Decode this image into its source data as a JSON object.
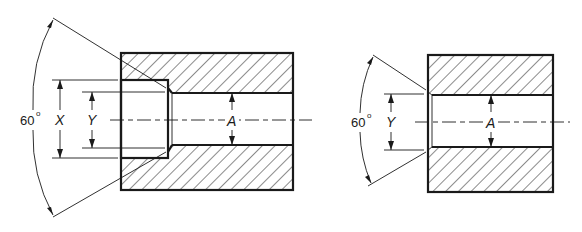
{
  "figure": {
    "left_view": {
      "name": "counterbored hole section",
      "angle_label": "60",
      "angle_unit": "o",
      "dim_outer_label": "X",
      "dim_inner_label": "Y",
      "bore_label": "A"
    },
    "right_view": {
      "name": "countersunk hole section",
      "angle_label": "60",
      "angle_unit": "o",
      "dim_inner_label": "Y",
      "bore_label": "A"
    },
    "colors": {
      "line": "#1a1a1a",
      "background": "#ffffff"
    }
  }
}
